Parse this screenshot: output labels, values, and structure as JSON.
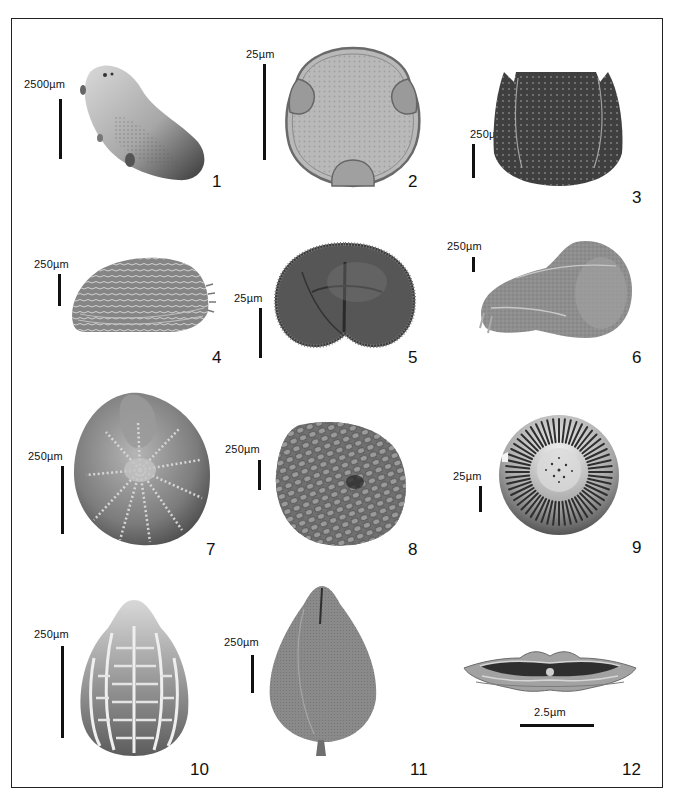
{
  "plate": {
    "figures": [
      {
        "number": "1",
        "scale": "2500µm",
        "description": "elongated seed/pellet, smooth with granular surface"
      },
      {
        "number": "2",
        "scale": "25µm",
        "description": "triporate pollen grain, light-microscope view"
      },
      {
        "number": "3",
        "scale": "250µm",
        "description": "dark reticulate seed, barrel-shaped"
      },
      {
        "number": "4",
        "scale": "250µm",
        "description": "ostracod-like valve with reticulate ornament and marginal spines"
      },
      {
        "number": "5",
        "scale": "25µm",
        "description": "dark kidney-shaped spore/pollen with fold"
      },
      {
        "number": "6",
        "scale": "250µm",
        "description": "curved seed/fruit with cap, SEM view"
      },
      {
        "number": "7",
        "scale": "250µm",
        "description": "coiled foraminifer with radiating sutures"
      },
      {
        "number": "8",
        "scale": "250µm",
        "description": "globular seed with tuberculate surface"
      },
      {
        "number": "9",
        "scale": "25µm",
        "description": "radially striate disc (diatom/coccolith)"
      },
      {
        "number": "10",
        "scale": "250µm",
        "description": "ovoid seed with longitudinal ribs and cross bars"
      },
      {
        "number": "11",
        "scale": "250µm",
        "description": "pear-shaped fruit with apical slit and stalk"
      },
      {
        "number": "12",
        "scale": "2.5µm",
        "description": "elongate pennate diatom with central nodule"
      }
    ]
  }
}
